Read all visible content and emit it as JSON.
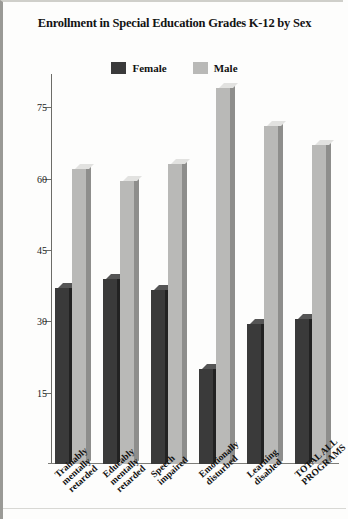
{
  "chart_title": "Enrollment in Special Education Grades K-12 by Sex",
  "legend": {
    "items": [
      {
        "label": "Female",
        "color": "#3a3a3a"
      },
      {
        "label": "Male",
        "color": "#b9b9b7"
      }
    ]
  },
  "axis": {
    "y_ticks": [
      "15",
      "30",
      "45",
      "60",
      "75"
    ],
    "y_min": 0,
    "y_max": 82
  },
  "chart_data": {
    "type": "bar",
    "title": "Enrollment in Special Education Grades K-12 by Sex",
    "xlabel": "",
    "ylabel": "",
    "ylim": [
      0,
      82
    ],
    "yticks": [
      15,
      30,
      45,
      60,
      75
    ],
    "grid": false,
    "legend_position": "top-center",
    "categories": [
      "Trainably mentally retarded",
      "Educably mentally retarded",
      "Speech impaired",
      "Emotionally disturbed",
      "Learning disabled",
      "TOTAL ALL PROGRAMS"
    ],
    "category_lines": [
      [
        "Trainably",
        "mentally",
        "retarded"
      ],
      [
        "Educably",
        "mentally",
        "retarded"
      ],
      [
        "Speech",
        "impaired"
      ],
      [
        "Emotionally",
        "disturbed"
      ],
      [
        "Learning",
        "disabled"
      ],
      [
        "TOTAL ALL",
        "PROGRAMS"
      ]
    ],
    "series": [
      {
        "name": "Female",
        "color": "#3a3a3a",
        "values": [
          37,
          39,
          36.5,
          20,
          29.5,
          30.5
        ]
      },
      {
        "name": "Male",
        "color": "#b9b9b7",
        "values": [
          62,
          59.5,
          63,
          79,
          71,
          67
        ]
      }
    ]
  }
}
